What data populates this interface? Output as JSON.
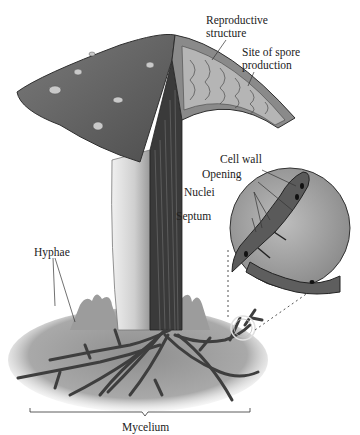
{
  "diagram": {
    "labels": {
      "reproductive_structure": "Reproductive\nstructure",
      "site_of_spore_production": "Site of spore\nproduction",
      "cell_wall": "Cell wall",
      "opening": "Opening",
      "nuclei": "Nuclei",
      "septum": "Septum",
      "hyphae": "Hyphae",
      "mycelium": "Mycelium"
    },
    "colors": {
      "cap": "#6e6e6e",
      "cap_dark": "#3e3e3e",
      "stalk": "#d8d8d8",
      "hyphae": "#4a4a4a",
      "ground": "#9a9a9a",
      "label_line": "#333333",
      "inset": "#a8a8a8"
    }
  }
}
